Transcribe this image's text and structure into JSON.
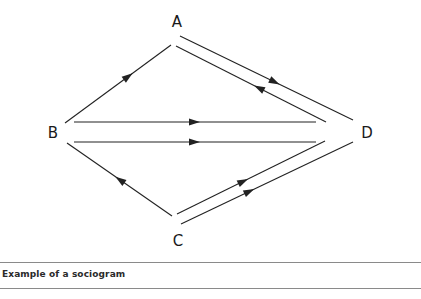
{
  "diagram": {
    "title": "Sociogram",
    "nodes": [
      {
        "id": "A",
        "label": "A",
        "x": 177,
        "y": 27
      },
      {
        "id": "B",
        "label": "B",
        "x": 53,
        "y": 138
      },
      {
        "id": "C",
        "label": "C",
        "x": 178,
        "y": 246
      },
      {
        "id": "D",
        "label": "D",
        "x": 367,
        "y": 138
      }
    ],
    "edges": [
      {
        "from": "B",
        "to": "A",
        "x1": 65,
        "y1": 123,
        "x2": 171,
        "y2": 45,
        "arrow_at": 0.6
      },
      {
        "from": "A",
        "to": "D",
        "x1": 180,
        "y1": 36,
        "x2": 353,
        "y2": 120,
        "arrow_at": 0.55
      },
      {
        "from": "D",
        "to": "A",
        "x1": 326,
        "y1": 122,
        "x2": 176,
        "y2": 46,
        "arrow_at": 0.45
      },
      {
        "from": "B",
        "to": "D",
        "x1": 74,
        "y1": 122,
        "x2": 316,
        "y2": 122,
        "arrow_at": 0.5
      },
      {
        "from": "B",
        "to": "D",
        "x1": 74,
        "y1": 142,
        "x2": 316,
        "y2": 142,
        "arrow_at": 0.5
      },
      {
        "from": "C",
        "to": "B",
        "x1": 172,
        "y1": 216,
        "x2": 67,
        "y2": 143,
        "arrow_at": 0.5
      },
      {
        "from": "C",
        "to": "D",
        "x1": 177,
        "y1": 214,
        "x2": 325,
        "y2": 141,
        "arrow_at": 0.45
      },
      {
        "from": "C",
        "to": "D",
        "x1": 181,
        "y1": 224,
        "x2": 353,
        "y2": 142,
        "arrow_at": 0.4
      }
    ]
  },
  "caption": {
    "text": "Example of a sociogram"
  }
}
